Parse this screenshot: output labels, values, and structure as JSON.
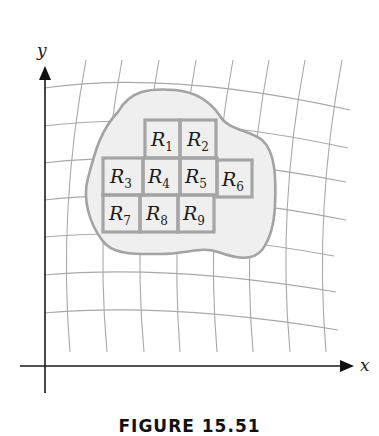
{
  "figure": {
    "caption": "FIGURE 15.51",
    "axes": {
      "x_label": "x",
      "y_label": "y"
    },
    "region": {
      "fill": "#efefef",
      "stroke": "#a3a3a3"
    },
    "grid": {
      "stroke": "#a9a9a9",
      "vertical_lines": 9,
      "horizontal_lines": 7
    },
    "cells": [
      {
        "letter": "R",
        "sub": "1"
      },
      {
        "letter": "R",
        "sub": "2"
      },
      {
        "letter": "R",
        "sub": "3"
      },
      {
        "letter": "R",
        "sub": "4"
      },
      {
        "letter": "R",
        "sub": "5"
      },
      {
        "letter": "R",
        "sub": "6"
      },
      {
        "letter": "R",
        "sub": "7"
      },
      {
        "letter": "R",
        "sub": "8"
      },
      {
        "letter": "R",
        "sub": "9"
      }
    ]
  }
}
